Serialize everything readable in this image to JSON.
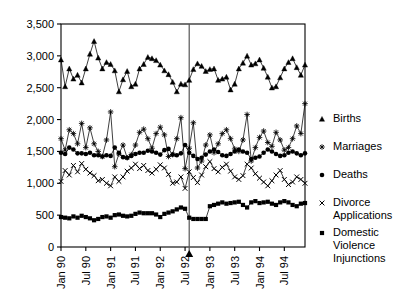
{
  "chart_data": {
    "type": "line",
    "title": "",
    "xlabel": "",
    "ylabel": "",
    "ylim": [
      0,
      3500
    ],
    "yticks": [
      0,
      500,
      1000,
      1500,
      2000,
      2500,
      3000,
      3500
    ],
    "ytick_labels": [
      "0",
      "500",
      "1,000",
      "1,500",
      "2,000",
      "2,500",
      "3,000",
      "3,500"
    ],
    "grid": false,
    "legend_position": "right",
    "x_axis_type": "monthly",
    "x_start": "Jan 90",
    "x_end": "Dec 94",
    "n_points": 60,
    "xticks": [
      0,
      6,
      12,
      18,
      24,
      30,
      36,
      42,
      48,
      54
    ],
    "xtick_labels": [
      "Jan 90",
      "Jul 90",
      "Jan 91",
      "Jul 91",
      "Jan 92",
      "Jul 92",
      "Jan 93",
      "Jul 93",
      "Jan 94",
      "Jul 94"
    ],
    "annotations": [
      {
        "name": "intervention-marker",
        "type": "vline-with-pointer",
        "x_index": 31,
        "label": ""
      }
    ],
    "series": [
      {
        "name": "Births",
        "marker": "triangle",
        "values": [
          2940,
          2520,
          2800,
          2640,
          2700,
          2580,
          2800,
          3030,
          3230,
          2970,
          2800,
          2900,
          2870,
          2770,
          2440,
          2630,
          2760,
          2520,
          2560,
          2800,
          2870,
          2980,
          2960,
          2930,
          2860,
          2770,
          2710,
          2590,
          2440,
          2560,
          2550,
          2620,
          2790,
          2880,
          2840,
          2760,
          2790,
          2800,
          2620,
          2640,
          2670,
          2470,
          2560,
          2800,
          2890,
          3000,
          2860,
          2880,
          2940,
          2810,
          2670,
          2500,
          2520,
          2660,
          2800,
          2900,
          2960,
          2820,
          2700,
          2860
        ]
      },
      {
        "name": "Marriages",
        "marker": "plus",
        "values": [
          1700,
          1520,
          1840,
          1780,
          1620,
          1940,
          1560,
          1870,
          1620,
          1500,
          1420,
          1680,
          2120,
          1260,
          1460,
          1600,
          1400,
          1450,
          1600,
          1800,
          1850,
          1700,
          1550,
          1780,
          1880,
          1760,
          1420,
          1450,
          1700,
          2030,
          1230,
          1550,
          1950,
          1240,
          1350,
          1600,
          1760,
          1480,
          1620,
          1780,
          1840,
          1700,
          1540,
          1500,
          1680,
          2080,
          1350,
          1560,
          1720,
          1820,
          1640,
          1580,
          1800,
          1680,
          1520,
          1560,
          1700,
          1900,
          1780,
          2250
        ]
      },
      {
        "name": "Deaths",
        "marker": "circle",
        "values": [
          1480,
          1460,
          1560,
          1530,
          1470,
          1470,
          1460,
          1480,
          1440,
          1440,
          1420,
          1440,
          1430,
          1560,
          1480,
          1410,
          1400,
          1430,
          1460,
          1480,
          1480,
          1510,
          1500,
          1480,
          1450,
          1520,
          1540,
          1450,
          1440,
          1470,
          1600,
          1480,
          1430,
          1380,
          1400,
          1450,
          1500,
          1530,
          1490,
          1440,
          1430,
          1460,
          1500,
          1530,
          1500,
          1480,
          1380,
          1400,
          1420,
          1480,
          1530,
          1500,
          1460,
          1430,
          1440,
          1480,
          1500,
          1470,
          1440,
          1470
        ]
      },
      {
        "name": "Divorce Applications",
        "marker": "x",
        "values": [
          1030,
          1200,
          1130,
          1280,
          1180,
          1310,
          1220,
          1160,
          1120,
          1040,
          1060,
          1000,
          960,
          1100,
          1030,
          1100,
          1190,
          1240,
          1300,
          1230,
          1280,
          1200,
          1160,
          1220,
          1290,
          1240,
          1140,
          1000,
          1020,
          1100,
          920,
          1180,
          1090,
          1010,
          1130,
          1260,
          1340,
          1230,
          1180,
          1250,
          1300,
          1190,
          1100,
          1060,
          1120,
          1300,
          1240,
          1150,
          1080,
          1020,
          960,
          1040,
          1130,
          1200,
          1060,
          980,
          1020,
          1100,
          1060,
          1000
        ]
      },
      {
        "name": "Domestic Violence Injunctions",
        "marker": "square",
        "values": [
          470,
          460,
          450,
          480,
          460,
          490,
          470,
          450,
          420,
          440,
          470,
          480,
          460,
          500,
          510,
          490,
          480,
          490,
          520,
          540,
          530,
          530,
          530,
          510,
          470,
          520,
          540,
          560,
          590,
          620,
          600,
          460,
          440,
          440,
          440,
          440,
          640,
          660,
          680,
          700,
          680,
          690,
          700,
          710,
          660,
          620,
          700,
          720,
          690,
          700,
          710,
          680,
          660,
          700,
          720,
          700,
          660,
          640,
          680,
          690
        ]
      }
    ]
  },
  "legend": {
    "entries": [
      {
        "label": "Births",
        "marker": "triangle"
      },
      {
        "label": "Marriages",
        "marker": "plus"
      },
      {
        "label": "Deaths",
        "marker": "circle"
      },
      {
        "label": "Divorce Applications",
        "marker": "x"
      },
      {
        "label": "Domestic Violence Injunctions",
        "marker": "square"
      }
    ]
  }
}
